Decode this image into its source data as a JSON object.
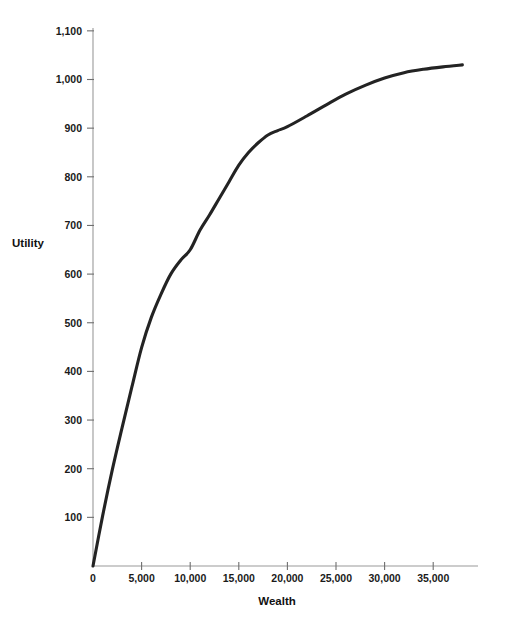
{
  "chart_data": {
    "type": "line",
    "title": "",
    "xlabel": "Wealth",
    "ylabel": "Utility",
    "xlim": [
      0,
      39500
    ],
    "ylim": [
      0,
      1100
    ],
    "grid": false,
    "legend": false,
    "x_ticks": [
      0,
      5000,
      10000,
      15000,
      20000,
      25000,
      30000,
      35000
    ],
    "x_tick_labels": [
      "0",
      "5,000",
      "10,000",
      "15,000",
      "20,000",
      "25,000",
      "30,000",
      "35,000"
    ],
    "y_ticks": [
      100,
      200,
      300,
      400,
      500,
      600,
      700,
      800,
      900,
      1000,
      1100
    ],
    "y_tick_labels": [
      "100",
      "200",
      "300",
      "400",
      "500",
      "600",
      "700",
      "800",
      "900",
      "1,000",
      "1,100"
    ],
    "series": [
      {
        "name": "Utility of wealth",
        "color": "#232323",
        "x": [
          0,
          1000,
          2000,
          3000,
          4000,
          5000,
          6000,
          7000,
          8000,
          9000,
          10000,
          11000,
          12000,
          13000,
          14000,
          15000,
          16000,
          17000,
          18000,
          19000,
          20000,
          22000,
          24000,
          26000,
          28000,
          30000,
          32000,
          34000,
          36000,
          38000
        ],
        "values": [
          0,
          104,
          199,
          285,
          368,
          449,
          511,
          559,
          600,
          628,
          650,
          690,
          722,
          756,
          790,
          824,
          850,
          870,
          886,
          895,
          903,
          925,
          948,
          970,
          988,
          1003,
          1014,
          1021,
          1026,
          1030
        ]
      }
    ],
    "annotations": []
  },
  "axis_titles": {
    "x": "Wealth",
    "y": "Utility"
  }
}
